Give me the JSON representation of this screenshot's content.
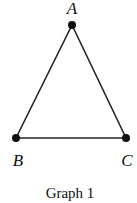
{
  "diagram": {
    "type": "graph",
    "caption": "Graph 1",
    "vertices": [
      {
        "id": "A",
        "label": "A",
        "x": 72,
        "y": 25,
        "label_x": 72,
        "label_y": 14
      },
      {
        "id": "B",
        "label": "B",
        "x": 16,
        "y": 138,
        "label_x": 18,
        "label_y": 165
      },
      {
        "id": "C",
        "label": "C",
        "x": 126,
        "y": 138,
        "label_x": 127,
        "label_y": 165
      }
    ],
    "edges": [
      {
        "from": "A",
        "to": "B"
      },
      {
        "from": "A",
        "to": "C"
      },
      {
        "from": "B",
        "to": "C"
      }
    ],
    "colors": {
      "stroke": "#222222",
      "vertex": "#111111",
      "background": "#ffffff"
    }
  }
}
